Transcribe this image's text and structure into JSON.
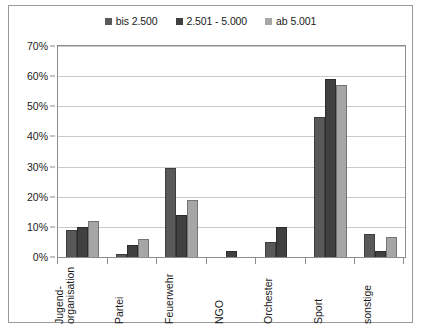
{
  "chart_data": {
    "type": "bar",
    "title": "",
    "xlabel": "",
    "ylabel": "",
    "ylim": [
      0,
      70
    ],
    "ytick_labels": [
      "0%",
      "10%",
      "20%",
      "30%",
      "40%",
      "50%",
      "60%",
      "70%"
    ],
    "ytick_values": [
      0,
      10,
      20,
      30,
      40,
      50,
      60,
      70
    ],
    "grid": true,
    "legend_position": "top-center",
    "categories": [
      "Jugend-organisation",
      "Partei",
      "Feuerwehr",
      "NGO",
      "Orchester",
      "Sport",
      "sonstige"
    ],
    "category_lines": [
      [
        "Jugend-",
        "organisation"
      ],
      [
        "Partei",
        ""
      ],
      [
        "Feuerwehr",
        ""
      ],
      [
        "NGO",
        ""
      ],
      [
        "Orchester",
        ""
      ],
      [
        "Sport",
        ""
      ],
      [
        "sonstige",
        ""
      ]
    ],
    "series": [
      {
        "name": "bis 2.500",
        "color": "#595959",
        "values": [
          9,
          1,
          29.5,
          0,
          5,
          46.5,
          7.5
        ]
      },
      {
        "name": "2.501 - 5.000",
        "color": "#404040",
        "values": [
          10,
          4,
          14,
          2,
          10,
          59,
          2
        ]
      },
      {
        "name": "ab 5.001",
        "color": "#a6a6a6",
        "values": [
          12,
          6,
          19,
          0,
          0,
          57,
          6.5
        ]
      }
    ]
  },
  "frame": {
    "border_color": "#9a9a9a",
    "plot_border_color": "#8c8c8c",
    "gridline_color": "#c9c9c9",
    "background": "#ffffff"
  }
}
